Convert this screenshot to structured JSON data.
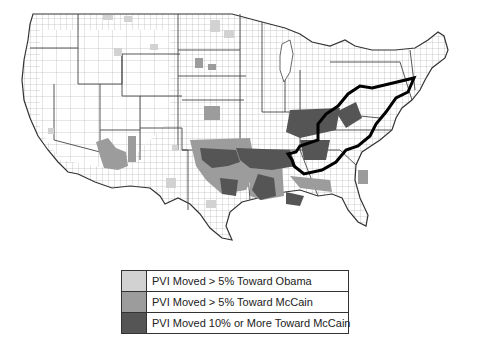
{
  "map": {
    "subject": "Change in Partisan Voting Index (PVI) by county, contiguous United States",
    "highlighted_region": "Appalachia (thick black outline)",
    "colors": {
      "background": "#ffffff",
      "county_border": "#8a8a8a",
      "state_border": "#444444",
      "toward_obama": "#d2d2d2",
      "toward_mccain_5": "#9c9c9c",
      "toward_mccain_10": "#555555",
      "region_outline": "#000000"
    }
  },
  "legend": {
    "items": [
      {
        "label": "PVI Moved > 5% Toward Obama",
        "color": "#d2d2d2"
      },
      {
        "label": "PVI Moved > 5% Toward McCain",
        "color": "#9c9c9c"
      },
      {
        "label": "PVI Moved 10% or More Toward McCain",
        "color": "#555555"
      }
    ]
  }
}
